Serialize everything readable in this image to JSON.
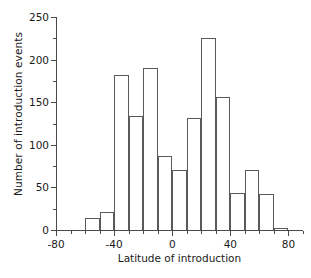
{
  "chart_data": {
    "type": "bar",
    "title": "",
    "subtitle": "",
    "xlabel": "Latitude of introduction",
    "ylabel": "Number of introduction events",
    "xlim": [
      -80,
      90
    ],
    "ylim": [
      0,
      250
    ],
    "bin_width": 10,
    "grid": false,
    "legend": "none",
    "x_major_ticks": [
      -80,
      -40,
      0,
      40,
      80
    ],
    "x_major_tick_labels": [
      "-80",
      "-40",
      "0",
      "40",
      "80"
    ],
    "x_minor_tick_step": 10,
    "y_major_ticks": [
      0,
      50,
      100,
      150,
      200,
      250
    ],
    "y_major_tick_labels": [
      "0",
      "50",
      "100",
      "150",
      "200",
      "250"
    ],
    "y_minor_tick_step": 25,
    "bin_edges": [
      -80,
      -70,
      -60,
      -50,
      -40,
      -30,
      -20,
      -10,
      0,
      10,
      20,
      30,
      40,
      50,
      60,
      70,
      80,
      90
    ],
    "bin_centers": [
      -75,
      -65,
      -55,
      -45,
      -35,
      -25,
      -15,
      -5,
      5,
      15,
      25,
      35,
      45,
      55,
      65,
      75,
      85
    ],
    "categories": [
      "-80 to -70",
      "-70 to -60",
      "-60 to -50",
      "-50 to -40",
      "-40 to -30",
      "-30 to -20",
      "-20 to -10",
      "-10 to 0",
      "0 to 10",
      "10 to 20",
      "20 to 30",
      "30 to 40",
      "40 to 50",
      "50 to 60",
      "60 to 70",
      "70 to 80",
      "80 to 90"
    ],
    "values": [
      0,
      0,
      14,
      21,
      182,
      134,
      190,
      87,
      70,
      132,
      225,
      156,
      43,
      70,
      42,
      2,
      0
    ]
  },
  "style": {
    "axis_color": "#4a4a4a",
    "bar_edge_color": "#5a5a5a",
    "bar_fill_color": "transparent",
    "background_color": "#ffffff",
    "text_color": "#1a1a1a"
  }
}
